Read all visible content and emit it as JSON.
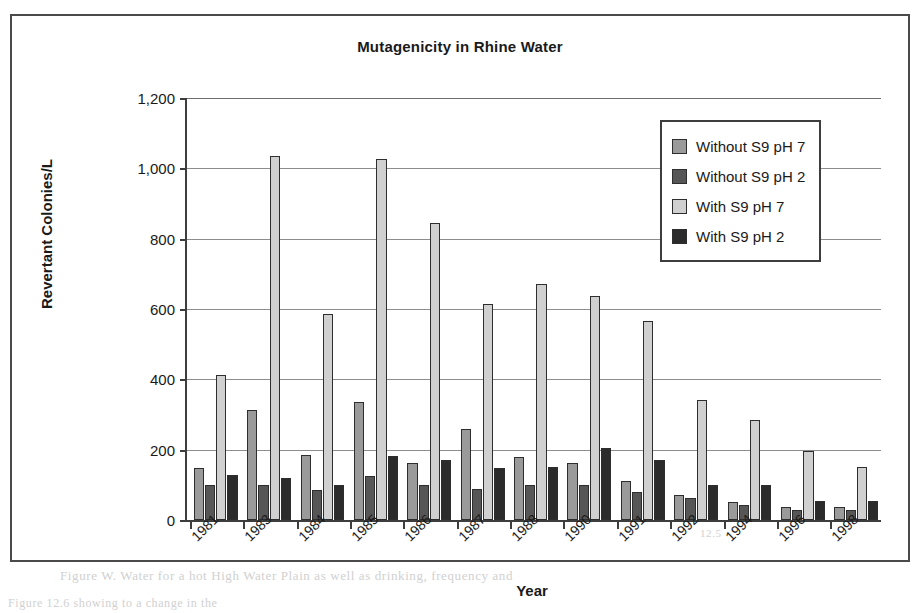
{
  "figure": {
    "title": "Mutagenicity in Rhine Water",
    "x_axis_title": "Year",
    "y_axis_title": "Revertant Colonies/L"
  },
  "legend": {
    "items": [
      {
        "label": "Without S9 pH 7",
        "color": "#9a9a9a"
      },
      {
        "label": "Without S9 pH 2",
        "color": "#565656"
      },
      {
        "label": "With S9 pH 7",
        "color": "#d0d0d0"
      },
      {
        "label": "With S9 pH 2",
        "color": "#2b2b2b"
      }
    ]
  },
  "ghost_text": {
    "top": "",
    "bottom": "Figure W. Water for a hot High Water Plain as well as drinking, frequency and",
    "under": "Figure 12.6 showing to a change in the",
    "right": "12.5"
  },
  "chart_data": {
    "type": "bar",
    "title": "Mutagenicity in Rhine Water",
    "xlabel": "Year",
    "ylabel": "Revertant Colonies/L",
    "ylim": [
      0,
      1200
    ],
    "yticks": [
      0,
      200,
      400,
      600,
      800,
      1000,
      1200
    ],
    "ytick_labels": [
      "0",
      "200",
      "400",
      "600",
      "800",
      "1,000",
      "1,200"
    ],
    "grid": true,
    "legend_position": "upper right",
    "categories": [
      "1981",
      "1983",
      "1984",
      "1985",
      "1986",
      "1987",
      "1988",
      "1990",
      "1991",
      "1992",
      "1994",
      "1996",
      "1998"
    ],
    "series": [
      {
        "name": "Without S9 pH 7",
        "color": "#9a9a9a",
        "values": [
          148,
          313,
          186,
          336,
          163,
          260,
          180,
          163,
          110,
          72,
          52,
          38,
          38
        ]
      },
      {
        "name": "Without S9 pH 2",
        "color": "#565656",
        "values": [
          100,
          100,
          85,
          126,
          100,
          88,
          100,
          100,
          80,
          62,
          42,
          28,
          28
        ]
      },
      {
        "name": "With S9 pH 7",
        "color": "#d0d0d0",
        "values": [
          412,
          1035,
          585,
          1028,
          845,
          615,
          672,
          638,
          565,
          340,
          283,
          197,
          152
        ]
      },
      {
        "name": "With S9 pH 2",
        "color": "#2b2b2b",
        "values": [
          128,
          120,
          100,
          182,
          172,
          148,
          152,
          205,
          172,
          100,
          100,
          55,
          55
        ]
      }
    ]
  }
}
